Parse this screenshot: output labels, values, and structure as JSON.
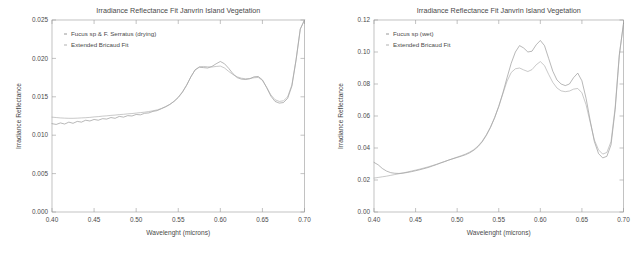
{
  "figure": {
    "panel_count": 2,
    "background": "#ffffff"
  },
  "chart_data": [
    {
      "panel": "left",
      "type": "line",
      "title": "Irradiance Reflectance Fit Janvrin Island Vegetation",
      "xlabel": "Wavelenght (microns)",
      "ylabel": "Irradiance Reflectance",
      "xlim": [
        0.4,
        0.7
      ],
      "ylim": [
        0.0,
        0.025
      ],
      "xticks": [
        0.4,
        0.45,
        0.5,
        0.55,
        0.6,
        0.65,
        0.7
      ],
      "xticklabels": [
        "0.40",
        "0.45",
        "0.50",
        "0.55",
        "0.60",
        "0.65",
        "0.70"
      ],
      "yticks": [
        0.0,
        0.005,
        0.01,
        0.015,
        0.02,
        0.025
      ],
      "yticklabels": [
        "0.000",
        "0.005",
        "0.010",
        "0.015",
        "0.020",
        "0.025"
      ],
      "grid": false,
      "legend_position": "upper-left",
      "series": [
        {
          "name": "Fucus sp & F. Serratus (drying)",
          "color": "#8c8c8c",
          "x": [
            0.4,
            0.405,
            0.41,
            0.415,
            0.42,
            0.425,
            0.43,
            0.435,
            0.44,
            0.445,
            0.45,
            0.455,
            0.46,
            0.465,
            0.47,
            0.475,
            0.48,
            0.485,
            0.49,
            0.495,
            0.5,
            0.505,
            0.51,
            0.515,
            0.52,
            0.525,
            0.53,
            0.535,
            0.54,
            0.545,
            0.55,
            0.555,
            0.56,
            0.565,
            0.57,
            0.575,
            0.58,
            0.585,
            0.59,
            0.595,
            0.6,
            0.605,
            0.61,
            0.615,
            0.62,
            0.625,
            0.63,
            0.635,
            0.64,
            0.645,
            0.65,
            0.655,
            0.66,
            0.665,
            0.67,
            0.675,
            0.68,
            0.685,
            0.69,
            0.695,
            0.7
          ],
          "y": [
            0.0115,
            0.0114,
            0.0116,
            0.01145,
            0.0117,
            0.01155,
            0.0118,
            0.0117,
            0.01195,
            0.01185,
            0.01205,
            0.01195,
            0.01215,
            0.0121,
            0.0123,
            0.0122,
            0.01245,
            0.01235,
            0.01255,
            0.0125,
            0.0127,
            0.01265,
            0.01285,
            0.0129,
            0.0131,
            0.0132,
            0.01345,
            0.0137,
            0.014,
            0.0144,
            0.0149,
            0.0156,
            0.0165,
            0.0176,
            0.0185,
            0.01885,
            0.0188,
            0.01875,
            0.01895,
            0.0193,
            0.0196,
            0.0193,
            0.0187,
            0.018,
            0.0175,
            0.0173,
            0.01725,
            0.01735,
            0.0176,
            0.01765,
            0.0172,
            0.0162,
            0.0151,
            0.0144,
            0.01418,
            0.01425,
            0.0148,
            0.0164,
            0.0198,
            0.0238,
            0.025
          ]
        },
        {
          "name": "Extended Bricaud Fit",
          "color": "#a8a8a8",
          "x": [
            0.4,
            0.405,
            0.41,
            0.415,
            0.42,
            0.425,
            0.43,
            0.435,
            0.44,
            0.445,
            0.45,
            0.455,
            0.46,
            0.465,
            0.47,
            0.475,
            0.48,
            0.485,
            0.49,
            0.495,
            0.5,
            0.505,
            0.51,
            0.515,
            0.52,
            0.525,
            0.53,
            0.535,
            0.54,
            0.545,
            0.55,
            0.555,
            0.56,
            0.565,
            0.57,
            0.575,
            0.58,
            0.585,
            0.59,
            0.595,
            0.6,
            0.605,
            0.61,
            0.615,
            0.62,
            0.625,
            0.63,
            0.635,
            0.64,
            0.645,
            0.65,
            0.655,
            0.66,
            0.665,
            0.67,
            0.675,
            0.68,
            0.685,
            0.69,
            0.695,
            0.7
          ],
          "y": [
            0.01235,
            0.0123,
            0.01225,
            0.01222,
            0.0122,
            0.0122,
            0.01222,
            0.01225,
            0.01228,
            0.01232,
            0.01238,
            0.01242,
            0.01248,
            0.01252,
            0.01258,
            0.01262,
            0.01268,
            0.01272,
            0.01278,
            0.01282,
            0.01288,
            0.01294,
            0.013,
            0.01308,
            0.01318,
            0.0133,
            0.01348,
            0.01372,
            0.01402,
            0.01442,
            0.01495,
            0.01565,
            0.01655,
            0.0176,
            0.0185,
            0.0189,
            0.01895,
            0.0189,
            0.01888,
            0.01895,
            0.019,
            0.01875,
            0.0183,
            0.0179,
            0.0176,
            0.01742,
            0.01735,
            0.01738,
            0.01748,
            0.01752,
            0.01715,
            0.01625,
            0.01525,
            0.01462,
            0.0144,
            0.01448,
            0.015,
            0.01655,
            0.01985,
            0.02385,
            0.025
          ]
        }
      ]
    },
    {
      "panel": "right",
      "type": "line",
      "title": "Irradiance Reflectance Fit Janvrin Island Vegetation",
      "xlabel": "Wavelenght (microns)",
      "ylabel": "Irradiance Reflectance",
      "xlim": [
        0.4,
        0.7
      ],
      "ylim": [
        0.0,
        0.12
      ],
      "xticks": [
        0.4,
        0.45,
        0.5,
        0.55,
        0.6,
        0.65,
        0.7
      ],
      "xticklabels": [
        "0.40",
        "0.45",
        "0.50",
        "0.55",
        "0.60",
        "0.65",
        "0.70"
      ],
      "yticks": [
        0.0,
        0.02,
        0.04,
        0.06,
        0.08,
        0.1,
        0.12
      ],
      "yticklabels": [
        "0.00",
        "0.02",
        "0.04",
        "0.06",
        "0.08",
        "0.10",
        "0.12"
      ],
      "grid": false,
      "legend_position": "upper-left",
      "series": [
        {
          "name": "Fucus sp (wet)",
          "color": "#8c8c8c",
          "x": [
            0.4,
            0.405,
            0.41,
            0.415,
            0.42,
            0.425,
            0.43,
            0.435,
            0.44,
            0.445,
            0.45,
            0.455,
            0.46,
            0.465,
            0.47,
            0.475,
            0.48,
            0.485,
            0.49,
            0.495,
            0.5,
            0.505,
            0.51,
            0.515,
            0.52,
            0.525,
            0.53,
            0.535,
            0.54,
            0.545,
            0.55,
            0.555,
            0.56,
            0.565,
            0.57,
            0.575,
            0.58,
            0.585,
            0.59,
            0.595,
            0.6,
            0.605,
            0.61,
            0.615,
            0.62,
            0.625,
            0.63,
            0.635,
            0.64,
            0.645,
            0.65,
            0.655,
            0.66,
            0.665,
            0.67,
            0.675,
            0.68,
            0.685,
            0.69,
            0.695,
            0.7
          ],
          "y": [
            0.031,
            0.0295,
            0.0272,
            0.0256,
            0.0246,
            0.0242,
            0.0241,
            0.0243,
            0.0247,
            0.0252,
            0.0258,
            0.0264,
            0.0271,
            0.0278,
            0.0287,
            0.0296,
            0.0306,
            0.0315,
            0.0325,
            0.0333,
            0.0341,
            0.0349,
            0.0358,
            0.037,
            0.0386,
            0.0408,
            0.0438,
            0.0478,
            0.0528,
            0.0588,
            0.066,
            0.0745,
            0.084,
            0.093,
            0.1,
            0.104,
            0.1025,
            0.1,
            0.1005,
            0.1045,
            0.1072,
            0.104,
            0.096,
            0.088,
            0.0825,
            0.08,
            0.079,
            0.08,
            0.084,
            0.0868,
            0.082,
            0.071,
            0.057,
            0.044,
            0.0365,
            0.0338,
            0.0348,
            0.042,
            0.064,
            0.098,
            0.118
          ]
        },
        {
          "name": "Extended Bricaud Fit",
          "color": "#a8a8a8",
          "x": [
            0.4,
            0.405,
            0.41,
            0.415,
            0.42,
            0.425,
            0.43,
            0.435,
            0.44,
            0.445,
            0.45,
            0.455,
            0.46,
            0.465,
            0.47,
            0.475,
            0.48,
            0.485,
            0.49,
            0.495,
            0.5,
            0.505,
            0.51,
            0.515,
            0.52,
            0.525,
            0.53,
            0.535,
            0.54,
            0.545,
            0.55,
            0.555,
            0.56,
            0.565,
            0.57,
            0.575,
            0.58,
            0.585,
            0.59,
            0.595,
            0.6,
            0.605,
            0.61,
            0.615,
            0.62,
            0.625,
            0.63,
            0.635,
            0.64,
            0.645,
            0.65,
            0.655,
            0.66,
            0.665,
            0.67,
            0.675,
            0.68,
            0.685,
            0.69,
            0.695,
            0.7
          ],
          "y": [
            0.0212,
            0.0216,
            0.022,
            0.0224,
            0.0229,
            0.0234,
            0.0239,
            0.0244,
            0.025,
            0.0256,
            0.0262,
            0.0268,
            0.0275,
            0.0282,
            0.029,
            0.0298,
            0.0307,
            0.0316,
            0.0325,
            0.0334,
            0.0343,
            0.0352,
            0.0362,
            0.0374,
            0.039,
            0.0412,
            0.0442,
            0.0482,
            0.053,
            0.059,
            0.066,
            0.074,
            0.0818,
            0.0872,
            0.0895,
            0.09,
            0.0888,
            0.0878,
            0.089,
            0.092,
            0.094,
            0.0915,
            0.086,
            0.081,
            0.0775,
            0.0757,
            0.0752,
            0.0756,
            0.0768,
            0.0772,
            0.0745,
            0.067,
            0.056,
            0.045,
            0.0388,
            0.0362,
            0.0372,
            0.044,
            0.0655,
            0.0985,
            0.1175
          ]
        }
      ]
    }
  ]
}
